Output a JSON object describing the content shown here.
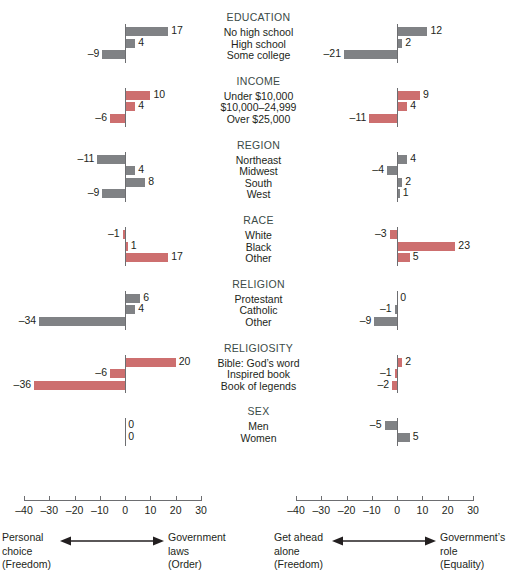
{
  "chart_data": {
    "type": "bar",
    "title": "",
    "orientation": "horizontal",
    "grid": false,
    "legend_position": "bottom",
    "xlim": [
      -40,
      30
    ],
    "xticks": [
      -40,
      -30,
      -20,
      -10,
      0,
      10,
      20,
      30
    ],
    "xtick_labels": [
      "–40",
      "–30",
      "–20",
      "–10",
      "0",
      "10",
      "20",
      "30"
    ],
    "panels": [
      {
        "id": "left",
        "axis_left_label": [
          "Personal",
          "choice",
          "(Freedom)"
        ],
        "axis_right_label": [
          "Government",
          "laws",
          "(Order)"
        ]
      },
      {
        "id": "right",
        "axis_left_label": [
          "Get ahead",
          "alone",
          "(Freedom)"
        ],
        "axis_right_label": [
          "Government’s",
          "role",
          "(Equality)"
        ]
      }
    ],
    "groups": [
      {
        "header": "EDUCATION",
        "rows": [
          {
            "label": "No high school",
            "left": 17,
            "right": 12,
            "left_color": "gray",
            "right_color": "gray"
          },
          {
            "label": "High school",
            "left": 4,
            "right": 2,
            "left_color": "gray",
            "right_color": "gray"
          },
          {
            "label": "Some college",
            "left": -9,
            "right": -21,
            "left_color": "gray",
            "right_color": "gray"
          }
        ]
      },
      {
        "header": "INCOME",
        "rows": [
          {
            "label": "Under $10,000",
            "left": 10,
            "right": 9,
            "left_color": "red",
            "right_color": "red"
          },
          {
            "label": "$10,000–24,999",
            "left": 4,
            "right": 4,
            "left_color": "red",
            "right_color": "red"
          },
          {
            "label": "Over $25,000",
            "left": -6,
            "right": -11,
            "left_color": "red",
            "right_color": "red"
          }
        ]
      },
      {
        "header": "REGION",
        "rows": [
          {
            "label": "Northeast",
            "left": -11,
            "right": 4,
            "left_color": "gray",
            "right_color": "gray"
          },
          {
            "label": "Midwest",
            "left": 4,
            "right": -4,
            "left_color": "gray",
            "right_color": "gray"
          },
          {
            "label": "South",
            "left": 8,
            "right": 2,
            "left_color": "gray",
            "right_color": "gray"
          },
          {
            "label": "West",
            "left": -9,
            "right": 1,
            "left_color": "gray",
            "right_color": "gray"
          }
        ]
      },
      {
        "header": "RACE",
        "rows": [
          {
            "label": "White",
            "left": -1,
            "right": -3,
            "left_color": "red",
            "right_color": "red"
          },
          {
            "label": "Black",
            "left": 1,
            "right": 23,
            "left_color": "red",
            "right_color": "red"
          },
          {
            "label": "Other",
            "left": 17,
            "right": 5,
            "left_color": "red",
            "right_color": "red"
          }
        ]
      },
      {
        "header": "RELIGION",
        "rows": [
          {
            "label": "Protestant",
            "left": 6,
            "right": 0,
            "left_color": "gray",
            "right_color": "gray"
          },
          {
            "label": "Catholic",
            "left": 4,
            "right": -1,
            "left_color": "gray",
            "right_color": "gray"
          },
          {
            "label": "Other",
            "left": -34,
            "right": -9,
            "left_color": "gray",
            "right_color": "gray"
          }
        ]
      },
      {
        "header": "RELIGIOSITY",
        "rows": [
          {
            "label": "Bible: God’s word",
            "left": 20,
            "right": 2,
            "left_color": "red",
            "right_color": "red"
          },
          {
            "label": "Inspired book",
            "left": -6,
            "right": -1,
            "left_color": "red",
            "right_color": "red"
          },
          {
            "label": "Book of legends",
            "left": -36,
            "right": -2,
            "left_color": "red",
            "right_color": "red"
          }
        ]
      },
      {
        "header": "SEX",
        "rows": [
          {
            "label": "Men",
            "left": 0,
            "right": -5,
            "left_color": "gray",
            "right_color": "gray"
          },
          {
            "label": "Women",
            "left": 0,
            "right": 5,
            "left_color": "gray",
            "right_color": "gray"
          }
        ]
      }
    ],
    "colors": {
      "gray": "#808285",
      "red": "#cd6f6f",
      "header_text": "#3b4a47",
      "body_text": "#231f20",
      "axis": "#6d6e71"
    }
  }
}
